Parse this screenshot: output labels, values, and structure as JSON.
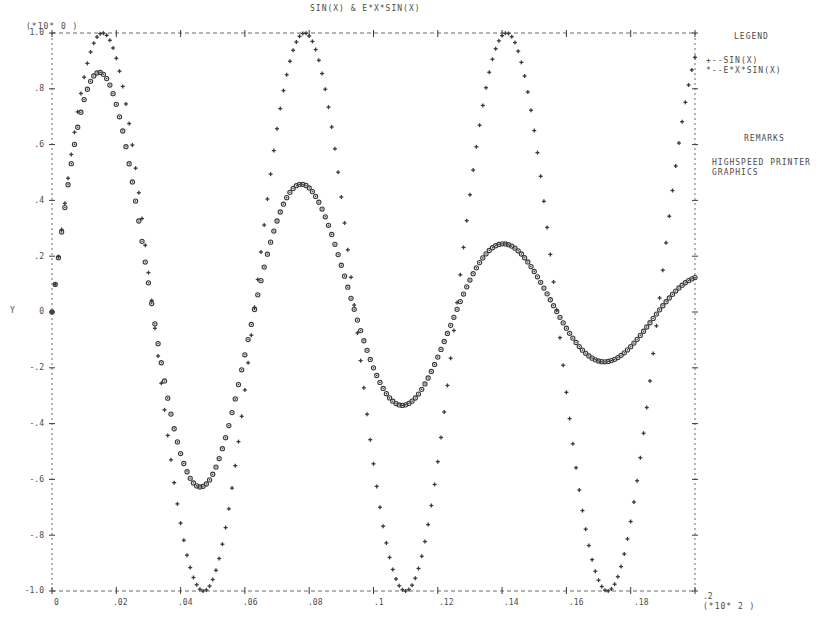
{
  "chart_data": {
    "type": "scatter",
    "title": "SIN(X) & E*X*SIN(X)",
    "xlabel": "",
    "ylabel": "Y",
    "x_scale_note": "(*10* 2 )",
    "y_scale_note": "(*10* 0 )",
    "xlim": [
      0,
      0.2
    ],
    "ylim": [
      -1.0,
      1.0
    ],
    "x_ticks": [
      "0",
      ".02",
      ".04",
      ".06",
      ".08",
      ".1",
      ".12",
      ".14",
      ".16",
      ".18",
      ".2"
    ],
    "y_ticks": [
      "1.0",
      ".8",
      ".6",
      ".4",
      ".2",
      "0",
      "-.2",
      "-.4",
      "-.6",
      "-.8",
      "-1.0"
    ],
    "grid": false,
    "legend_position": "right",
    "series": [
      {
        "name": "SIN(X)",
        "marker": "+",
        "x": [
          0.0,
          0.01,
          0.02,
          0.03,
          0.04,
          0.047,
          0.05,
          0.06,
          0.07,
          0.079,
          0.09,
          0.1,
          0.11,
          0.12,
          0.13,
          0.141,
          0.15,
          0.16,
          0.17,
          0.173,
          0.18,
          0.19,
          0.2
        ],
        "values": [
          0.0,
          0.84,
          0.91,
          0.14,
          -0.76,
          -1.0,
          -0.96,
          -0.28,
          0.66,
          1.0,
          0.41,
          -0.54,
          -1.0,
          -0.54,
          0.42,
          1.0,
          0.65,
          -0.29,
          -0.96,
          -1.0,
          -0.75,
          0.15,
          0.91
        ]
      },
      {
        "name": "E*X*SIN(X)",
        "marker": "o",
        "x": [
          0.0,
          0.012,
          0.02,
          0.03,
          0.046,
          0.06,
          0.077,
          0.09,
          0.108,
          0.12,
          0.138,
          0.15,
          0.173,
          0.19,
          0.2
        ],
        "values": [
          0.0,
          0.84,
          0.6,
          0.1,
          -0.62,
          -0.2,
          0.44,
          0.16,
          -0.3,
          -0.12,
          0.25,
          0.05,
          -0.15,
          0.02,
          0.13
        ]
      }
    ]
  },
  "legend": {
    "title": "LEGEND",
    "items": [
      {
        "label": "+--SIN(X)"
      },
      {
        "label": "*--E*X*SIN(X)"
      }
    ]
  },
  "remarks": {
    "title": "REMARKS",
    "lines": [
      "HIGHSPEED PRINTER",
      "GRAPHICS"
    ]
  },
  "colors": {
    "ink": "#3a3a3a",
    "paper": "#ffffff"
  }
}
